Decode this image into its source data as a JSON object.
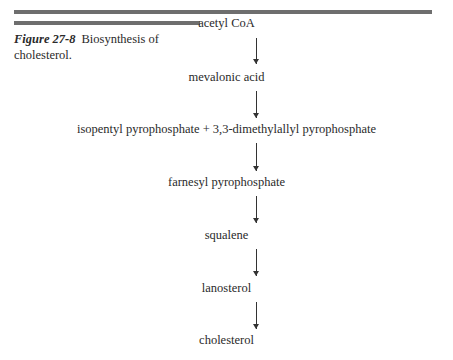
{
  "figure": {
    "number": "Figure 27-8",
    "caption": "Biosynthesis of cholesterol."
  },
  "pathway": {
    "steps": [
      "acetyl CoA",
      "mevalonic acid",
      "isopentyl pyrophosphate + 3,3-dimethylallyl pyrophosphate",
      "farnesyl pyrophosphate",
      "squalene",
      "lanosterol",
      "cholesterol"
    ]
  }
}
